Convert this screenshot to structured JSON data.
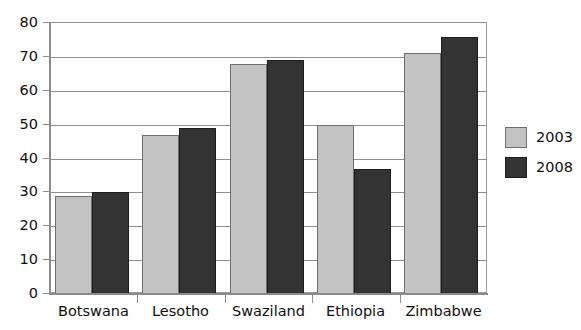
{
  "chart_data": {
    "type": "bar",
    "title": "",
    "subtitle": "",
    "xlabel": "",
    "ylabel": "",
    "categories": [
      "Botswana",
      "Lesotho",
      "Swaziland",
      "Ethiopia",
      "Zimbabwe"
    ],
    "series": [
      {
        "name": "2003",
        "color": "#c3c3c3",
        "values": [
          29,
          47,
          68,
          50,
          71
        ]
      },
      {
        "name": "2008",
        "color": "#333333",
        "values": [
          30,
          49,
          69,
          37,
          76
        ]
      }
    ],
    "ylim": [
      0,
      80
    ],
    "ytick_labels": [
      "80",
      "70",
      "60",
      "50",
      "40",
      "30",
      "20",
      "10",
      "0"
    ],
    "ytick_values": [
      80,
      70,
      60,
      50,
      40,
      30,
      20,
      10,
      0
    ],
    "grid": true,
    "grid_axis": "y",
    "legend": {
      "position": "right",
      "entries": [
        {
          "label": "2003",
          "color": "#c3c3c3"
        },
        {
          "label": "2008",
          "color": "#333333"
        }
      ]
    },
    "frame": true,
    "annotations": []
  }
}
